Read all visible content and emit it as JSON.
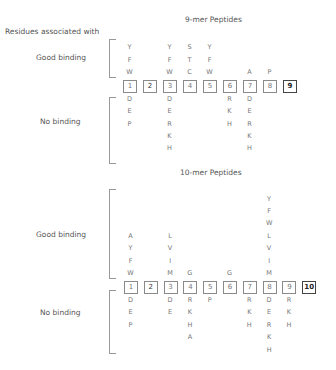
{
  "header": {
    "residues_label": "Residues associated with"
  },
  "nine_mer": {
    "title": "9-mer Peptides",
    "good_label": "Good binding",
    "no_label": "No binding",
    "positions": [
      "1",
      "2",
      "3",
      "4",
      "5",
      "6",
      "7",
      "8",
      "9"
    ],
    "good": [
      [
        "Y",
        "F",
        "W"
      ],
      [],
      [
        "Y",
        "F",
        "W"
      ],
      [
        "S",
        "T",
        "C"
      ],
      [
        "Y",
        "F",
        "W"
      ],
      [],
      [
        "A"
      ],
      [
        "P"
      ],
      []
    ],
    "none": [
      [
        "D",
        "E",
        "P"
      ],
      [],
      [
        "D",
        "E",
        "R",
        "K",
        "H"
      ],
      [],
      [],
      [
        "R",
        "K",
        "H"
      ],
      [
        "D",
        "E",
        "R",
        "K",
        "H"
      ],
      [],
      []
    ]
  },
  "ten_mer": {
    "title": "10-mer Peptides",
    "good_label": "Good binding",
    "no_label": "No binding",
    "positions": [
      "1",
      "2",
      "3",
      "4",
      "5",
      "6",
      "7",
      "8",
      "9",
      "10"
    ],
    "good": [
      [
        "A",
        "Y",
        "F",
        "W"
      ],
      [],
      [
        "L",
        "V",
        "I",
        "M"
      ],
      [
        "G"
      ],
      [],
      [
        "G"
      ],
      [],
      [
        "Y",
        "F",
        "W",
        "L",
        "V",
        "I",
        "M"
      ],
      [],
      []
    ],
    "none": [
      [
        "D",
        "E",
        "P"
      ],
      [],
      [
        "D",
        "E"
      ],
      [
        "R",
        "K",
        "H",
        "A"
      ],
      [
        "P"
      ],
      [],
      [
        "R",
        "K",
        "H"
      ],
      [
        "D",
        "E",
        "R",
        "K",
        "H"
      ],
      [
        "R",
        "K",
        "H"
      ],
      []
    ]
  }
}
